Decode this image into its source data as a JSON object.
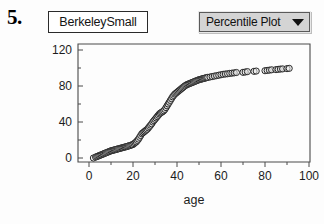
{
  "item": {
    "number": "5."
  },
  "dataset": {
    "name": "BerkeleySmall"
  },
  "plot_selector": {
    "label": "Percentile Plot",
    "arrow_icon": "triangle-down-icon",
    "options": [
      "Percentile Plot"
    ],
    "fill_color": "#d4d4d4",
    "border_color": "#5a5a5a"
  },
  "chart_data": {
    "type": "scatter",
    "title": "",
    "subtitle": "",
    "xlabel": "age",
    "ylabel": "",
    "xlim": [
      0,
      100
    ],
    "ylim": [
      0,
      120
    ],
    "grid": false,
    "legend": null,
    "marker": {
      "shape": "open-circle",
      "radius": 3.1,
      "stroke": "#2a2a2a",
      "fill": "#e9e9e9"
    },
    "xticks": [
      0,
      20,
      40,
      60,
      80,
      100
    ],
    "xtick_labels": [
      "0",
      "20",
      "40",
      "60",
      "80",
      "100"
    ],
    "xminor_ticks": [
      10,
      30,
      50,
      70,
      90
    ],
    "yticks": [
      0,
      40,
      80,
      120
    ],
    "ytick_labels": [
      "0",
      "40",
      "80",
      "120"
    ],
    "yminor_ticks": [
      20,
      60,
      100
    ],
    "x": [
      2,
      3,
      3.5,
      4,
      4.5,
      5,
      5.5,
      6,
      6.5,
      7,
      7.5,
      8,
      8.5,
      9,
      9.5,
      10,
      10.5,
      11,
      11.5,
      12,
      12.5,
      13,
      13.5,
      14,
      14.5,
      15,
      15.5,
      16,
      16.5,
      17,
      17.5,
      18,
      18.5,
      19,
      19.5,
      20,
      20.5,
      21,
      21.5,
      22,
      22.5,
      23,
      23.5,
      24,
      24.5,
      25,
      25.5,
      26,
      26.5,
      27,
      27.5,
      28,
      28.5,
      29,
      29.5,
      30,
      30.5,
      31,
      31.5,
      32,
      32.5,
      33,
      33.5,
      34,
      34.5,
      35,
      35.5,
      36,
      36.5,
      37,
      37.5,
      38,
      38.5,
      39,
      39.5,
      40,
      40.5,
      41,
      41.5,
      42,
      42.5,
      43,
      43.5,
      44,
      44.5,
      45,
      45.5,
      46,
      46.5,
      47,
      47.5,
      48,
      48.5,
      49,
      49.5,
      50,
      50.5,
      51,
      51.5,
      52,
      52.5,
      53,
      53.5,
      54,
      55,
      56,
      57,
      58,
      59,
      60,
      61,
      62,
      63,
      64,
      65,
      66,
      67,
      70,
      71,
      72,
      75,
      76,
      80,
      81,
      82,
      83,
      85,
      86,
      87,
      88,
      90,
      91
    ],
    "y": [
      0,
      1,
      1.5,
      2,
      2.5,
      3,
      3.5,
      4,
      4.5,
      5,
      5.5,
      6,
      6.5,
      7,
      7.5,
      8,
      8.3,
      8.6,
      9,
      9.3,
      9.6,
      10,
      10.3,
      10.6,
      11,
      11.3,
      11.6,
      12,
      12.3,
      12.6,
      13,
      13.4,
      13.8,
      14.2,
      14.6,
      15,
      16,
      17,
      18,
      19.5,
      21,
      23,
      25,
      27,
      28,
      29,
      30,
      31,
      32,
      33.5,
      35,
      36.5,
      38,
      40,
      41.5,
      43,
      44.5,
      46,
      47.5,
      49,
      50,
      50.8,
      51.5,
      52.5,
      54,
      56,
      58,
      60,
      62,
      64,
      66,
      68,
      69.5,
      71,
      72,
      73,
      74,
      75,
      76,
      77,
      78,
      79,
      80,
      80.8,
      81.5,
      82,
      82.5,
      83,
      83.5,
      84,
      84.5,
      85,
      85.5,
      86,
      86.5,
      87,
      87.3,
      87.6,
      88,
      88.3,
      88.6,
      89,
      89.3,
      89.6,
      90,
      90.5,
      91,
      91.5,
      92,
      92.5,
      93,
      93.3,
      93.6,
      94,
      94.3,
      94.6,
      95,
      95.2,
      95.5,
      96,
      96.3,
      96.6,
      97,
      97.3,
      97.6,
      98,
      98.2,
      98.5,
      98.8,
      99,
      99.3,
      99.6,
      100,
      100.3
    ]
  }
}
